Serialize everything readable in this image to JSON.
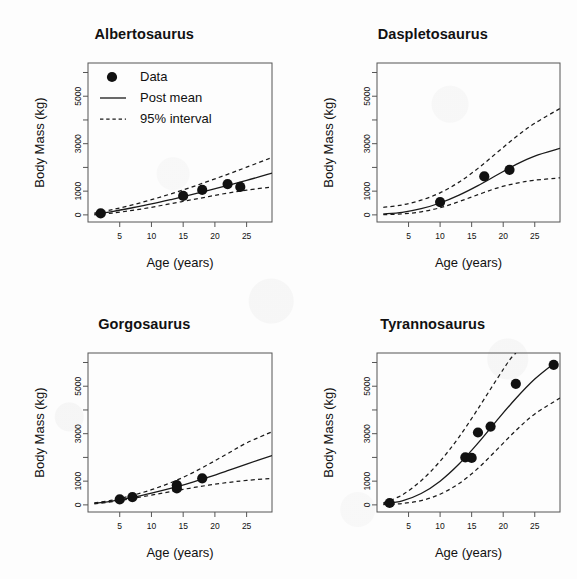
{
  "figure": {
    "shared_xlabel": "Age (years)",
    "shared_ylabel": "Body Mass (kg)",
    "xticks": [
      5,
      10,
      15,
      20,
      25
    ],
    "yticks_major": [
      0,
      1000,
      3000,
      5000
    ],
    "yticks_minor": [
      2000,
      4000,
      6000
    ],
    "xlim": [
      0,
      29
    ],
    "ylim": [
      -300,
      6400
    ]
  },
  "legend": {
    "data_label": "Data",
    "mean_label": "Post mean",
    "interval_label": "95% interval"
  },
  "chart_data": [
    {
      "type": "scatter",
      "title": "Albertosaurus",
      "xlabel": "Age (years)",
      "ylabel": "Body Mass (kg)",
      "xlim": [
        0,
        29
      ],
      "ylim": [
        -300,
        6400
      ],
      "grid": false,
      "legend": "top-left",
      "points": [
        {
          "x": 2,
          "y": 60
        },
        {
          "x": 15,
          "y": 800
        },
        {
          "x": 18,
          "y": 1050
        },
        {
          "x": 22,
          "y": 1300
        },
        {
          "x": 24,
          "y": 1180
        }
      ],
      "series": [
        {
          "name": "Post mean",
          "style": "solid",
          "x": [
            1,
            4,
            7,
            10,
            13,
            16,
            19,
            22,
            25,
            29
          ],
          "values": [
            30,
            150,
            300,
            460,
            640,
            830,
            1030,
            1240,
            1450,
            1760
          ]
        },
        {
          "name": "95% upper",
          "style": "dashed",
          "x": [
            1,
            4,
            7,
            10,
            13,
            16,
            19,
            22,
            25,
            29
          ],
          "values": [
            70,
            230,
            420,
            640,
            880,
            1140,
            1420,
            1710,
            2010,
            2420
          ]
        },
        {
          "name": "95% lower",
          "style": "dashed",
          "x": [
            1,
            4,
            7,
            10,
            13,
            16,
            19,
            22,
            25,
            29
          ],
          "values": [
            5,
            80,
            190,
            320,
            470,
            620,
            770,
            920,
            1040,
            1180
          ]
        }
      ]
    },
    {
      "type": "scatter",
      "title": "Daspletosaurus",
      "xlabel": "Age (years)",
      "ylabel": "Body Mass (kg)",
      "xlim": [
        0,
        29
      ],
      "ylim": [
        -300,
        6400
      ],
      "grid": false,
      "legend": "none",
      "points": [
        {
          "x": 10,
          "y": 540
        },
        {
          "x": 17,
          "y": 1620
        },
        {
          "x": 21,
          "y": 1900
        }
      ],
      "series": [
        {
          "name": "Post mean",
          "style": "solid",
          "x": [
            1,
            4,
            7,
            10,
            13,
            16,
            19,
            22,
            25,
            29
          ],
          "values": [
            40,
            110,
            260,
            500,
            830,
            1230,
            1680,
            2120,
            2480,
            2800
          ]
        },
        {
          "name": "95% upper",
          "style": "dashed",
          "x": [
            1,
            4,
            7,
            10,
            13,
            16,
            19,
            22,
            25,
            29
          ],
          "values": [
            320,
            420,
            620,
            930,
            1380,
            1960,
            2620,
            3280,
            3860,
            4480
          ]
        },
        {
          "name": "95% lower",
          "style": "dashed",
          "x": [
            1,
            4,
            7,
            10,
            13,
            16,
            19,
            22,
            25,
            29
          ],
          "values": [
            10,
            40,
            130,
            300,
            560,
            850,
            1130,
            1330,
            1460,
            1560
          ]
        }
      ]
    },
    {
      "type": "scatter",
      "title": "Gorgosaurus",
      "xlabel": "Age (years)",
      "ylabel": "Body Mass (kg)",
      "xlim": [
        0,
        29
      ],
      "ylim": [
        -300,
        6400
      ],
      "grid": false,
      "legend": "none",
      "points": [
        {
          "x": 5,
          "y": 230
        },
        {
          "x": 7,
          "y": 330
        },
        {
          "x": 14,
          "y": 690
        },
        {
          "x": 14,
          "y": 830
        },
        {
          "x": 18,
          "y": 1120
        }
      ],
      "series": [
        {
          "name": "Post mean",
          "style": "solid",
          "x": [
            1,
            4,
            7,
            10,
            13,
            16,
            19,
            22,
            25,
            29
          ],
          "values": [
            60,
            170,
            320,
            500,
            700,
            920,
            1170,
            1440,
            1720,
            2080
          ]
        },
        {
          "name": "95% upper",
          "style": "dashed",
          "x": [
            1,
            4,
            7,
            10,
            13,
            16,
            19,
            22,
            25,
            29
          ],
          "values": [
            80,
            210,
            400,
            640,
            930,
            1290,
            1710,
            2160,
            2610,
            3080
          ]
        },
        {
          "name": "95% lower",
          "style": "dashed",
          "x": [
            1,
            4,
            7,
            10,
            13,
            16,
            19,
            22,
            25,
            29
          ],
          "values": [
            40,
            140,
            270,
            410,
            560,
            700,
            830,
            940,
            1030,
            1120
          ]
        }
      ]
    },
    {
      "type": "scatter",
      "title": "Tyrannosaurus",
      "xlabel": "Age (years)",
      "ylabel": "Body Mass (kg)",
      "xlim": [
        0,
        29
      ],
      "ylim": [
        -300,
        6400
      ],
      "grid": false,
      "legend": "none",
      "points": [
        {
          "x": 2,
          "y": 80
        },
        {
          "x": 14,
          "y": 2000
        },
        {
          "x": 15,
          "y": 1980
        },
        {
          "x": 16,
          "y": 3050
        },
        {
          "x": 18,
          "y": 3300
        },
        {
          "x": 22,
          "y": 5100
        },
        {
          "x": 28,
          "y": 5900
        }
      ],
      "series": [
        {
          "name": "Post mean",
          "style": "solid",
          "x": [
            1,
            4,
            7,
            10,
            13,
            16,
            19,
            22,
            25,
            28
          ],
          "values": [
            40,
            170,
            480,
            1000,
            1720,
            2600,
            3560,
            4480,
            5300,
            5950
          ]
        },
        {
          "name": "95% upper",
          "style": "dashed",
          "x": [
            1,
            4,
            7,
            10,
            13,
            16,
            19,
            21,
            22
          ],
          "values": [
            80,
            420,
            1020,
            1840,
            2860,
            4050,
            5300,
            6100,
            6400
          ]
        },
        {
          "name": "95% lower",
          "style": "dashed",
          "x": [
            1,
            4,
            7,
            10,
            13,
            16,
            19,
            22,
            25,
            29
          ],
          "values": [
            10,
            60,
            180,
            450,
            900,
            1540,
            2330,
            3130,
            3830,
            4500
          ]
        }
      ]
    }
  ]
}
